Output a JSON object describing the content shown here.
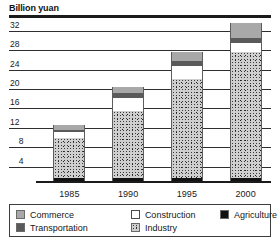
{
  "chart_data": {
    "type": "bar",
    "title": "Billion yuan",
    "xlabel": "",
    "ylabel": "Billion yuan",
    "ylim": [
      0,
      34
    ],
    "yticks": [
      4,
      8,
      12,
      16,
      20,
      24,
      28,
      32
    ],
    "grid": true,
    "stacked": true,
    "legend_position": "bottom",
    "categories": [
      "1985",
      "1990",
      "1995",
      "2000"
    ],
    "series": [
      {
        "name": "Agriculture",
        "color": "#111111",
        "values": [
          0.6,
          0.6,
          0.7,
          0.7
        ]
      },
      {
        "name": "Industry",
        "color": "#cfcfcf",
        "values": [
          8.3,
          13.9,
          20.3,
          25.8
        ]
      },
      {
        "name": "Construction",
        "color": "#ffffff",
        "values": [
          1.2,
          2.7,
          2.8,
          2.0
        ]
      },
      {
        "name": "Transportation",
        "color": "#5a5a5a",
        "values": [
          0.5,
          0.9,
          1.0,
          1.0
        ]
      },
      {
        "name": "Commerce",
        "color": "#a8a8a8",
        "values": [
          1.0,
          1.3,
          1.7,
          3.0
        ]
      }
    ],
    "totals": [
      11.6,
      19.4,
      26.5,
      32.5
    ]
  },
  "legend": {
    "row1": [
      {
        "label": "Commerce",
        "swatch": "commerce"
      },
      {
        "label": "Construction",
        "swatch": "construction"
      },
      {
        "label": "Agriculture",
        "swatch": "agriculture"
      }
    ],
    "row2": [
      {
        "label": "Transportation",
        "swatch": "transportation"
      },
      {
        "label": "Industry",
        "swatch": "industry"
      }
    ]
  }
}
